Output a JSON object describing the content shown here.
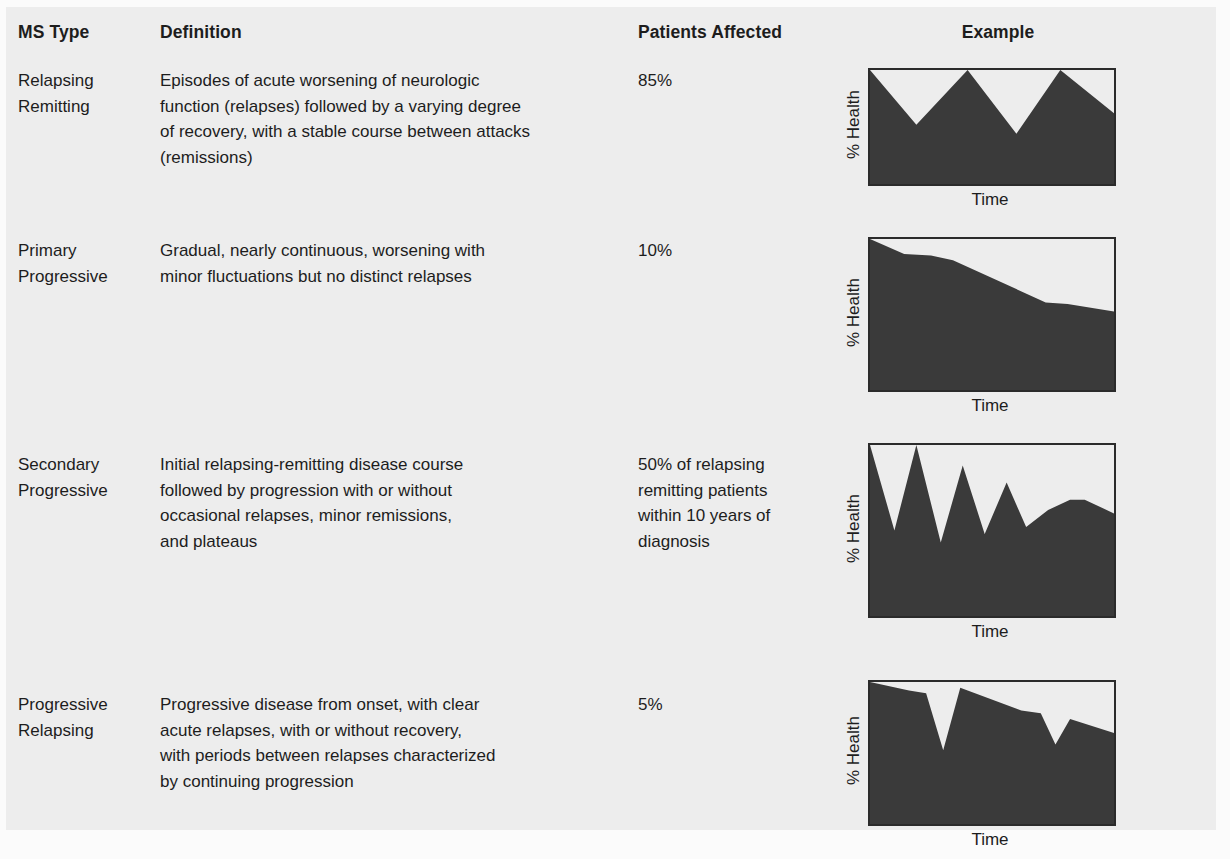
{
  "headers": {
    "ms_type": "MS Type",
    "definition": "Definition",
    "patients_affected": "Patients Affected",
    "example": "Example"
  },
  "colors": {
    "page_background": "#ededed",
    "paper_margin": "#fbfbfb",
    "text": "#1d1d1d",
    "chart_fill": "#3a3a3a",
    "chart_border": "#2b2b2b",
    "chart_plot_background": "#ededed"
  },
  "rows": [
    {
      "type_lines": [
        "Relapsing",
        "Remitting"
      ],
      "definition_lines": [
        "Episodes of acute worsening of neurologic",
        "function (relapses) followed by a varying degree",
        "of recovery, with a stable course between attacks",
        "(remissions)"
      ],
      "patients_lines": [
        "85%"
      ],
      "patients_value": "85%"
    },
    {
      "type_lines": [
        "Primary",
        "Progressive"
      ],
      "definition_lines": [
        "Gradual, nearly continuous, worsening with",
        "minor fluctuations but no distinct relapses"
      ],
      "patients_lines": [
        "10%"
      ],
      "patients_value": "10%"
    },
    {
      "type_lines": [
        "Secondary",
        "Progressive"
      ],
      "definition_lines": [
        "Initial relapsing-remitting disease course",
        "followed by progression with or without",
        "occasional relapses, minor remissions,",
        "and plateaus"
      ],
      "patients_lines": [
        "50% of relapsing",
        "remitting patients",
        "within 10 years of",
        "diagnosis"
      ],
      "patients_value": "50%"
    },
    {
      "type_lines": [
        "Progressive",
        "Relapsing"
      ],
      "definition_lines": [
        "Progressive disease from onset, with clear",
        "acute relapses, with or without recovery,",
        "with periods between relapses characterized",
        "by continuing progression"
      ],
      "patients_lines": [
        "5%"
      ],
      "patients_value": "5%"
    }
  ],
  "chart_data": [
    {
      "type": "area",
      "title": "Relapsing Remitting",
      "xlabel": "Time",
      "ylabel": "% Health",
      "xlim": [
        0,
        100
      ],
      "ylim": [
        0,
        100
      ],
      "grid": false,
      "legend": null,
      "width": 244,
      "height": 114,
      "x": [
        0,
        19,
        40,
        60,
        78,
        100
      ],
      "y": [
        100,
        52,
        100,
        44,
        100,
        62
      ],
      "description": "Sawtooth: full-health peaks separated by acute relapse dips with recovery back to baseline."
    },
    {
      "type": "area",
      "title": "Primary Progressive",
      "xlabel": "Time",
      "ylabel": "% Health",
      "xlim": [
        0,
        100
      ],
      "ylim": [
        0,
        100
      ],
      "grid": false,
      "legend": null,
      "width": 244,
      "height": 151,
      "x": [
        0,
        14,
        25,
        34,
        72,
        81,
        100
      ],
      "y": [
        100,
        90,
        89,
        86,
        58,
        57,
        52
      ],
      "description": "Steady, nearly continuous decline from full health with two short plateaus and no distinct relapses."
    },
    {
      "type": "area",
      "title": "Secondary Progressive",
      "xlabel": "Time",
      "ylabel": "% Health",
      "xlim": [
        0,
        100
      ],
      "ylim": [
        0,
        100
      ],
      "grid": false,
      "legend": null,
      "width": 244,
      "height": 171,
      "x": [
        0,
        10,
        19,
        29,
        38,
        47,
        56,
        64,
        73,
        82,
        88,
        100
      ],
      "y": [
        100,
        50,
        100,
        43,
        88,
        48,
        78,
        52,
        62,
        68,
        68,
        60
      ],
      "description": "Early relapsing-remitting sawtooth that transitions into steady progression with lower peaks and rising baseline disability."
    },
    {
      "type": "area",
      "title": "Progressive Relapsing",
      "xlabel": "Time",
      "ylabel": "% Health",
      "xlim": [
        0,
        100
      ],
      "ylim": [
        0,
        100
      ],
      "grid": false,
      "legend": null,
      "width": 244,
      "height": 142,
      "x": [
        0,
        16,
        23,
        30,
        37,
        62,
        70,
        76,
        82,
        100
      ],
      "y": [
        100,
        94,
        92,
        52,
        96,
        80,
        78,
        56,
        74,
        64
      ],
      "description": "Progression from onset with superimposed acute relapses and partial recovery, continuing decline between relapses."
    }
  ]
}
